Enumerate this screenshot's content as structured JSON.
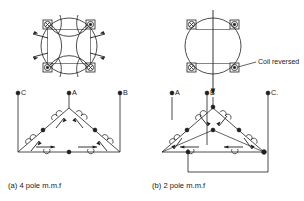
{
  "figure": {
    "title_visible": false,
    "background": "#ffffff",
    "line_color": "#1f1f1f",
    "panels": [
      {
        "id": "panel-a",
        "caption": "(a)  4 pole m.m.f",
        "caption_index": "(a)",
        "caption_text": "4 pole m.m.f",
        "machine": {
          "type": "stator-cross-section",
          "pole_count": 4,
          "slots": [
            {
              "position": "top-left",
              "marker": "cross",
              "symbol": "⊗"
            },
            {
              "position": "top-right",
              "marker": "dot",
              "symbol": "⊙"
            },
            {
              "position": "bottom-left",
              "marker": "dot",
              "symbol": "⊙"
            },
            {
              "position": "bottom-right",
              "marker": "cross",
              "symbol": "⊗"
            }
          ],
          "flux_arrows": [
            {
              "side": "left",
              "direction": "outward"
            },
            {
              "side": "left",
              "direction": "outward"
            },
            {
              "side": "right",
              "direction": "outward"
            },
            {
              "side": "right",
              "direction": "outward"
            }
          ]
        },
        "winding": {
          "type": "delta",
          "terminals": [
            {
              "label": "C",
              "position": "left"
            },
            {
              "label": "A",
              "position": "apex"
            },
            {
              "label": "B",
              "position": "right"
            }
          ],
          "coils_per_side": 2,
          "coil_sides": [
            "left",
            "right",
            "bottom"
          ],
          "arrow_sense": "outward"
        }
      },
      {
        "id": "panel-b",
        "caption": "(b)   2 pole  m.m.f",
        "caption_index": "(b)",
        "caption_text": "2 pole  m.m.f",
        "annotation": {
          "label": "Coil reversed",
          "leader": true,
          "target_slot": "bottom-right"
        },
        "machine": {
          "type": "stator-cross-section",
          "pole_count": 2,
          "slots": [
            {
              "position": "top-left",
              "marker": "cross",
              "symbol": "⊗"
            },
            {
              "position": "top-right",
              "marker": "dot",
              "symbol": "⊙"
            },
            {
              "position": "bottom-left",
              "marker": "cross",
              "symbol": "⊗"
            },
            {
              "position": "bottom-right",
              "marker": "dot",
              "symbol": "⊙"
            }
          ],
          "flux_arrows": [
            {
              "side": "center",
              "direction": "downward"
            }
          ]
        },
        "winding": {
          "type": "delta",
          "terminals": [
            {
              "label": "A",
              "position": "left"
            },
            {
              "label": "B",
              "position": "right-inner"
            },
            {
              "label": "C.",
              "position": "far-right"
            }
          ],
          "coils_per_side": 2,
          "coil_sides": [
            "left",
            "right",
            "bottom"
          ],
          "arrow_sense": "inward"
        }
      }
    ]
  }
}
